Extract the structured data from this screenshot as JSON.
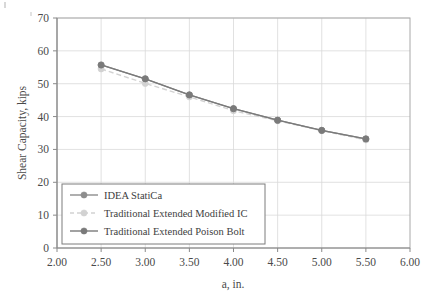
{
  "chart_data": {
    "type": "line",
    "title": "",
    "xlabel": "a, in.",
    "ylabel": "Shear Capacity, kips",
    "x": [
      2.5,
      3.0,
      3.5,
      4.0,
      4.5,
      5.0,
      5.5
    ],
    "xlim": [
      2.0,
      6.0
    ],
    "ylim": [
      0,
      70
    ],
    "xticks": [
      "2.00",
      "2.50",
      "3.00",
      "3.50",
      "4.00",
      "4.50",
      "5.00",
      "5.50",
      "6.00"
    ],
    "xtick_values": [
      2.0,
      2.5,
      3.0,
      3.5,
      4.0,
      4.5,
      5.0,
      5.5,
      6.0
    ],
    "yticks": [
      "0",
      "10",
      "20",
      "30",
      "40",
      "50",
      "60",
      "70"
    ],
    "ytick_values": [
      0,
      10,
      20,
      30,
      40,
      50,
      60,
      70
    ],
    "grid": true,
    "legend_position": "lower-left-inside",
    "series": [
      {
        "name": "IDEA StatiCa",
        "values": [
          55.7,
          51.5,
          46.6,
          42.4,
          38.9,
          35.8,
          33.2
        ],
        "color": "#8d8d8d",
        "style": "solid",
        "marker": "circle"
      },
      {
        "name": "Traditional Extended Modified IC",
        "values": [
          54.5,
          50.1,
          46.0,
          41.8,
          38.7,
          35.7,
          32.9
        ],
        "color": "#d2d2d2",
        "style": "dashed",
        "marker": "circle"
      },
      {
        "name": "Traditional Extended Poison Bolt",
        "values": [
          55.7,
          51.5,
          46.6,
          42.4,
          38.9,
          35.8,
          33.2
        ],
        "color": "#7a7a7a",
        "style": "solid",
        "marker": "circle"
      }
    ]
  },
  "axes": {
    "y_title": "Shear Capacity, kips",
    "x_title": "a, in.",
    "x_tick_labels": [
      "2.00",
      "2.50",
      "3.00",
      "3.50",
      "4.00",
      "4.50",
      "5.00",
      "5.50",
      "6.00"
    ],
    "y_tick_labels": [
      "0",
      "10",
      "20",
      "30",
      "40",
      "50",
      "60",
      "70"
    ]
  },
  "legend": {
    "items": [
      {
        "label": "IDEA StatiCa"
      },
      {
        "label": "Traditional Extended Modified IC"
      },
      {
        "label": "Traditional Extended Poison Bolt"
      }
    ]
  },
  "colors": {
    "grid": "#d9d9d9",
    "axis": "#9a9a9a",
    "series_primary": "#8d8d8d",
    "series_light": "#d2d2d2",
    "series_dark": "#7a7a7a",
    "text": "#4a4a4a",
    "background": "#ffffff"
  }
}
